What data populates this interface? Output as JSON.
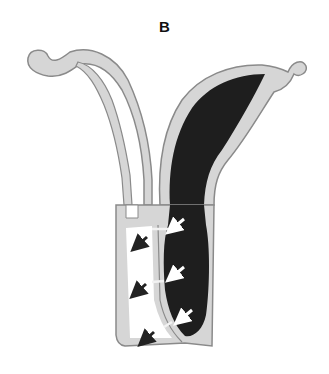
{
  "figure": {
    "panel_label": "B",
    "colors": {
      "wall_fill": "#d6d6d6",
      "wall_outline": "#8a8a8a",
      "dark_contents": "#1e1e1e",
      "lumen_empty": "#ffffff",
      "arrow_white": "#ffffff",
      "arrow_dark": "#222222"
    },
    "arrows": {
      "white_arrows_count": 3,
      "dark_arrows_count": 3,
      "direction": "down-left"
    }
  }
}
